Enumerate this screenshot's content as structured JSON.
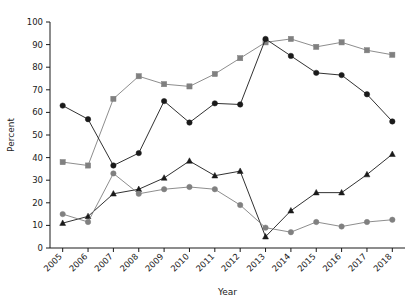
{
  "chart_data": {
    "type": "line",
    "title": "",
    "xlabel": "Year",
    "ylabel": "Percent",
    "categories": [
      "2005",
      "2006",
      "2007",
      "2008",
      "2009",
      "2010",
      "2011",
      "2012",
      "2013",
      "2014",
      "2015",
      "2016",
      "2017",
      "2018"
    ],
    "x": [
      2005,
      2006,
      2007,
      2008,
      2009,
      2010,
      2011,
      2012,
      2013,
      2014,
      2015,
      2016,
      2017,
      2018
    ],
    "xlim": [
      2004.5,
      2018.5
    ],
    "ylim": [
      0,
      100
    ],
    "yticks": [
      0,
      10,
      20,
      30,
      40,
      50,
      60,
      70,
      80,
      90,
      100
    ],
    "grid": false,
    "legend": "none",
    "series": [
      {
        "name": "series-gray-square",
        "marker": "square",
        "color": "#808080",
        "values": [
          38,
          36.5,
          66,
          76,
          72.5,
          71.5,
          77,
          84,
          91,
          92.5,
          89,
          91,
          87.5,
          85.5
        ]
      },
      {
        "name": "series-black-circle",
        "marker": "circle",
        "color": "#1a1a1a",
        "values": [
          63,
          57,
          36.5,
          42,
          65,
          55.5,
          64,
          63.5,
          92.5,
          85,
          77.5,
          76.5,
          68,
          56
        ]
      },
      {
        "name": "series-black-triangle",
        "marker": "triangle",
        "color": "#1a1a1a",
        "values": [
          11,
          14,
          24,
          26,
          31,
          38.5,
          32,
          34,
          5,
          16.5,
          24.5,
          24.5,
          32.5,
          41.5
        ]
      },
      {
        "name": "series-gray-circle",
        "marker": "circle",
        "color": "#808080",
        "values": [
          15,
          11.5,
          33,
          24,
          26,
          27,
          26,
          19,
          9,
          7,
          11.5,
          9.5,
          11.5,
          12.5
        ]
      }
    ]
  },
  "yaxis": {
    "labels": [
      "0",
      "10",
      "20",
      "30",
      "40",
      "50",
      "60",
      "70",
      "80",
      "90",
      "100"
    ],
    "title": "Percent"
  },
  "xaxis": {
    "labels": [
      "2005",
      "2006",
      "2007",
      "2008",
      "2009",
      "2010",
      "2011",
      "2012",
      "2013",
      "2014",
      "2015",
      "2016",
      "2017",
      "2018"
    ],
    "title": "Year"
  },
  "colors": {
    "gray": "#808080",
    "black": "#1a1a1a",
    "background": "#ffffff"
  }
}
